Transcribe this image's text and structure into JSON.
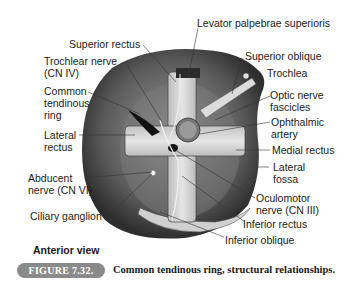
{
  "figure": {
    "number_label": "FIGURE 7.32.",
    "caption": "Common tendinous ring, structural relationships.",
    "view_label": "Anterior view"
  },
  "labels": {
    "levator": "Levator palpebrae superioris",
    "superior_rectus": "Superior rectus",
    "trochlear_1": "Trochlear nerve",
    "trochlear_2": "(CN IV)",
    "common_1": "Common",
    "common_2": "tendinous",
    "common_3": "ring",
    "lateral_rectus_1": "Lateral",
    "lateral_rectus_2": "rectus",
    "abducent_1": "Abducent",
    "abducent_2": "nerve (CN VI)",
    "ciliary": "Ciliary ganglion",
    "superior_oblique": "Superior oblique",
    "trochlea": "Trochlea",
    "optic_1": "Optic nerve",
    "optic_2": "fascicles",
    "ophthalmic_1": "Ophthalmic",
    "ophthalmic_2": "artery",
    "medial_rectus": "Medial rectus",
    "lateral_fossa_1": "Lateral",
    "lateral_fossa_2": "fossa",
    "oculomotor_1": "Oculomotor",
    "oculomotor_2": "nerve (CN III)",
    "inferior_rectus": "Inferior rectus",
    "inferior_oblique": "Inferior oblique"
  },
  "colors": {
    "badge_bg": "#8a8a8a",
    "orbit_dark": "#4a4a4a",
    "muscle_light": "#d9d9d9"
  }
}
